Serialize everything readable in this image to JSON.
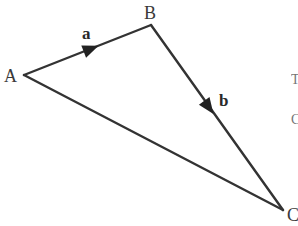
{
  "diagram": {
    "type": "vector-triangle",
    "colors": {
      "line": "#333333",
      "text": "#3a3a3a",
      "background": "#ffffff"
    },
    "points": {
      "A": {
        "label": "A",
        "x": 24,
        "y": 75
      },
      "B": {
        "label": "B",
        "x": 151,
        "y": 25
      },
      "C": {
        "label": "C",
        "x": 283,
        "y": 210
      }
    },
    "edges": [
      {
        "from": "A",
        "to": "B",
        "vector_label": "a",
        "arrow": true
      },
      {
        "from": "B",
        "to": "C",
        "vector_label": "b",
        "arrow": true
      },
      {
        "from": "A",
        "to": "C",
        "vector_label": "",
        "arrow": false
      }
    ],
    "labels": {
      "A": "A",
      "B": "B",
      "C": "C",
      "a": "a",
      "b": "b"
    },
    "clipped_text": {
      "right_edge_1": "T",
      "right_edge_2": "C"
    }
  }
}
